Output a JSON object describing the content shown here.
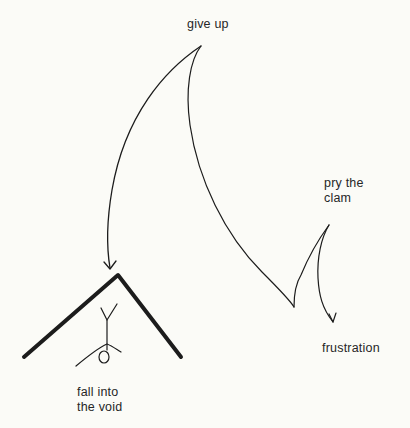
{
  "diagram": {
    "nodes": [
      {
        "id": "give-up",
        "label": "give up"
      },
      {
        "id": "pry-the-clam",
        "label": "pry the\nclam"
      },
      {
        "id": "frustration",
        "label": "frustration"
      },
      {
        "id": "fall-into-the-void",
        "label": "fall into\nthe void"
      }
    ],
    "edges": [
      {
        "from": "give-up",
        "to": "fall-into-the-void",
        "arrow": true
      },
      {
        "from": "give-up",
        "to": "pry-the-clam",
        "arrow": false,
        "note": "long curve descending to a cusp then rising"
      },
      {
        "from": "pry-the-clam",
        "to": "frustration",
        "arrow": true
      }
    ],
    "illustration": "roof-shaped void with an upside-down stick figure",
    "ink_color": "#1c1c1c",
    "background_color": "#fbfbf7"
  }
}
